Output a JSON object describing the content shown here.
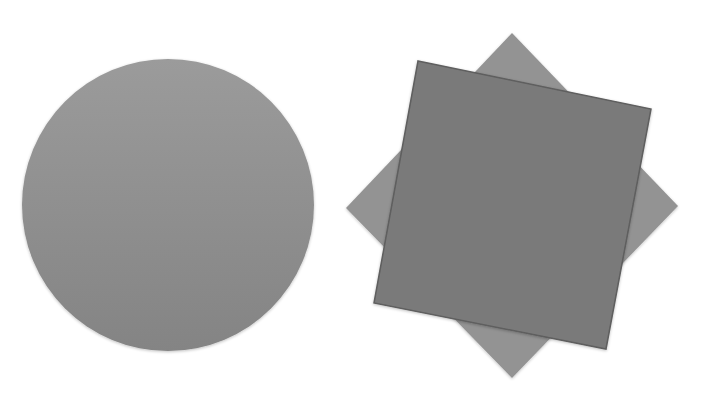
{
  "canvas": {
    "width": 702,
    "height": 407,
    "background": "#ffffff"
  },
  "shapes": {
    "circle": {
      "cx": 168,
      "cy": 205,
      "r": 146,
      "fill_top": "#9b9b9b",
      "fill_bottom": "#848484"
    },
    "diamond": {
      "points": "512,33 678,206 512,378 346,208",
      "fill": "#939393"
    },
    "square": {
      "points": "418,61 651,109 606,349 374,303",
      "fill": "#7a7a7a",
      "stroke": "#5e5e5e"
    }
  }
}
